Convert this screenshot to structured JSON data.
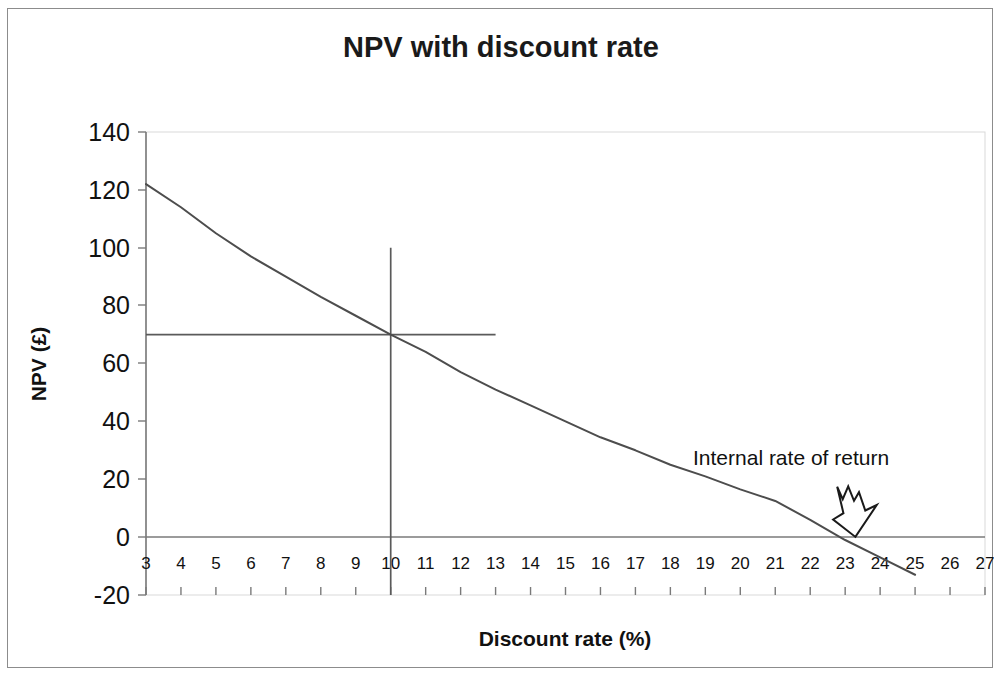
{
  "chart_data": {
    "type": "line",
    "title": "NPV with discount rate",
    "xlabel": "Discount rate (%)",
    "ylabel": "NPV (£)",
    "xlim": [
      3,
      27
    ],
    "ylim": [
      -20,
      140
    ],
    "xticks": [
      3,
      4,
      5,
      6,
      7,
      8,
      9,
      10,
      11,
      12,
      13,
      14,
      15,
      16,
      17,
      18,
      19,
      20,
      21,
      22,
      23,
      24,
      25,
      26,
      27
    ],
    "yticks": [
      -20,
      0,
      20,
      40,
      60,
      80,
      100,
      120,
      140
    ],
    "xtick_labels": [
      "3",
      "4",
      "5",
      "6",
      "7",
      "8",
      "9",
      "10",
      "11",
      "12",
      "13",
      "14",
      "15",
      "16",
      "17",
      "18",
      "19",
      "20",
      "21",
      "22",
      "23",
      "24",
      "25",
      "26",
      "27"
    ],
    "ytick_labels": [
      "140",
      "120",
      "100",
      "80",
      "60",
      "40",
      "20",
      "0",
      "-20"
    ],
    "grid": false,
    "legend": "none",
    "series": [
      {
        "name": "NPV",
        "x": [
          3,
          4,
          5,
          6,
          7,
          8,
          9,
          10,
          11,
          12,
          13,
          14,
          15,
          16,
          17,
          18,
          19,
          20,
          21,
          22,
          23,
          24,
          25
        ],
        "values": [
          122,
          114,
          105,
          97,
          90,
          83,
          76.5,
          70,
          64,
          57,
          51,
          45.5,
          40,
          34.5,
          30,
          25,
          21,
          16.5,
          12.5,
          6,
          -1,
          -7,
          -13
        ]
      }
    ],
    "annotations": [
      {
        "name": "internal-rate-of-return",
        "text": "Internal rate of return",
        "points_to_x": 22.9,
        "points_to_y": 0
      }
    ],
    "guides": [
      {
        "name": "npv-horizontal-guide",
        "orientation": "horizontal",
        "value": 70,
        "from_x": 3,
        "to_x": 13
      },
      {
        "name": "discount-rate-vertical-guide",
        "orientation": "vertical",
        "value": 10,
        "from_y": -20,
        "to_y": 100
      }
    ]
  }
}
